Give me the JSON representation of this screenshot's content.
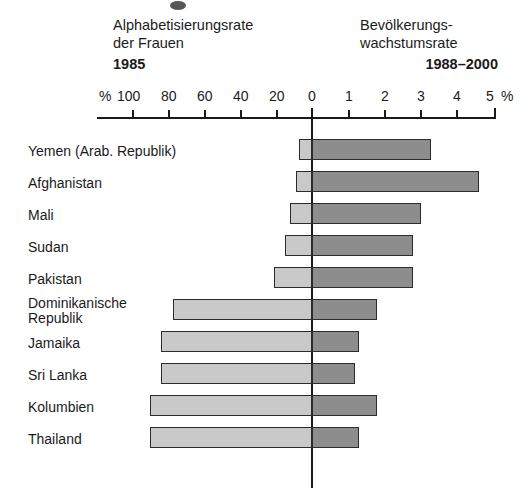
{
  "headings": {
    "left_line1": "Alphabetisierungsrate",
    "left_line2": "der Frauen",
    "left_year": "1985",
    "right_line1": "Bevölkerungs-",
    "right_line2": "wachstumsrate",
    "right_year": "1988–2000"
  },
  "axis": {
    "left_unit": "%",
    "right_unit": "%",
    "left_ticks": [
      "100",
      "80",
      "60",
      "40",
      "20"
    ],
    "zero": "0",
    "right_ticks": [
      "1",
      "2",
      "3",
      "4",
      "5"
    ]
  },
  "chart_data": {
    "type": "bar",
    "orientation": "horizontal-diverging",
    "categories": [
      "Yemen (Arab. Republik)",
      "Afghanistan",
      "Mali",
      "Sudan",
      "Pakistan",
      "Dominikanische\nRepublik",
      "Jamaika",
      "Sri Lanka",
      "Kolumbien",
      "Thailand"
    ],
    "series": [
      {
        "name": "Alphabetisierungsrate der Frauen 1985",
        "side": "left",
        "unit": "%",
        "axis_max": 100,
        "color": "#c9c9c9",
        "values": [
          7,
          9,
          12,
          15,
          21,
          77,
          84,
          84,
          90,
          90
        ]
      },
      {
        "name": "Bevölkerungswachstumsrate 1988–2000",
        "side": "right",
        "unit": "%",
        "axis_max": 5,
        "color": "#8d8d8d",
        "values": [
          3.3,
          4.6,
          3.0,
          2.8,
          2.8,
          1.8,
          1.3,
          1.2,
          1.8,
          1.3
        ]
      }
    ],
    "xlabel": "",
    "ylabel": "",
    "grid": false,
    "legend": "none",
    "left_axis_ticks": [
      100,
      80,
      60,
      40,
      20,
      0
    ],
    "right_axis_ticks": [
      0,
      1,
      2,
      3,
      4,
      5
    ]
  },
  "colors": {
    "left_bar": "#c9c9c9",
    "right_bar": "#8d8d8d",
    "bar_border": "#2b2b2b",
    "axis": "#1a1a1a",
    "background": "#ffffff"
  }
}
